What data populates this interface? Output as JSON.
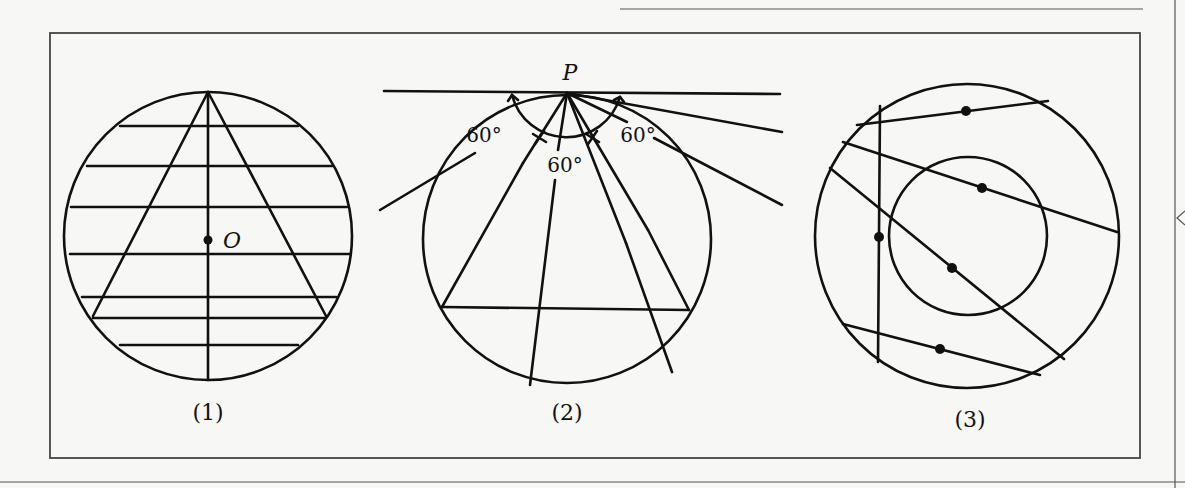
{
  "figure": {
    "panels": [
      {
        "id": "1",
        "caption": "(1)",
        "point_label": "O"
      },
      {
        "id": "2",
        "caption": "(2)",
        "point_label": "P",
        "angle_labels": [
          "60°",
          "60°",
          "60°"
        ]
      },
      {
        "id": "3",
        "caption": "(3)"
      }
    ]
  },
  "colors": {
    "ink": "#111111",
    "paper": "#f7f7f5",
    "frame": "#444444"
  }
}
